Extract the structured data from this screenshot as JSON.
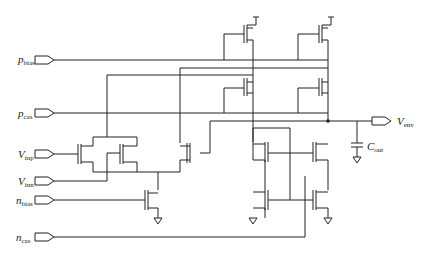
{
  "diagram": {
    "type": "circuit-schematic",
    "inputs": [
      {
        "name": "p",
        "sub": "bias"
      },
      {
        "name": "p",
        "sub": "cas"
      },
      {
        "name": "V",
        "sub": "inp"
      },
      {
        "name": "V",
        "sub": "inn"
      },
      {
        "name": "n",
        "sub": "bias"
      },
      {
        "name": "n",
        "sub": "cas"
      }
    ],
    "output": {
      "name": "V",
      "sub": "env"
    },
    "capacitor": {
      "name": "C",
      "sub": "out"
    }
  }
}
